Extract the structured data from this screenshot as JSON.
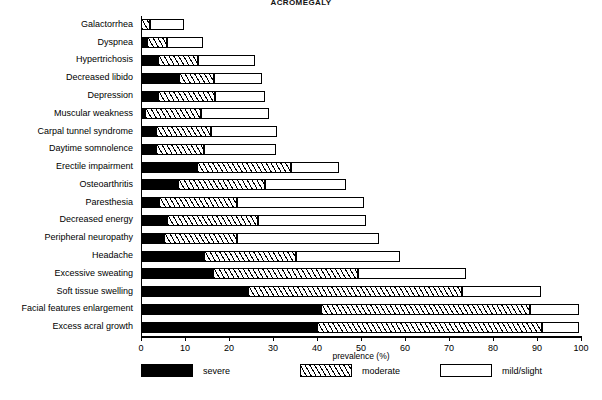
{
  "chart_data": {
    "type": "bar",
    "orientation": "horizontal",
    "stacked": true,
    "title": "ACROMEGALY",
    "xlabel": "prevalence (%)",
    "ylabel": "",
    "xlim": [
      0,
      100
    ],
    "xticks": [
      0,
      10,
      20,
      30,
      40,
      50,
      60,
      70,
      80,
      90,
      100
    ],
    "grid": false,
    "legend_position": "bottom",
    "categories": [
      "Galactorrhea",
      "Dyspnea",
      "Hypertrichosis",
      "Decreased libido",
      "Depression",
      "Muscular weakness",
      "Carpal tunnel syndrome",
      "Daytime somnolence",
      "Erectile impairment",
      "Osteoarthritis",
      "Paresthesia",
      "Decreased energy",
      "Peripheral neuropathy",
      "Headache",
      "Excessive sweating",
      "Soft tissue swelling",
      "Facial features enlargement",
      "Excess acral growth"
    ],
    "series": [
      {
        "name": "severe",
        "pattern": "solid-black",
        "color": "#000000",
        "values": [
          0.0,
          1.3,
          3.8,
          8.7,
          3.8,
          1.0,
          3.5,
          3.5,
          12.8,
          8.5,
          4.2,
          6.0,
          5.2,
          14.3,
          16.3,
          24.3,
          41.0,
          39.9
        ]
      },
      {
        "name": "moderate",
        "pattern": "hatched",
        "color": "#ffffff",
        "values": [
          2.0,
          4.5,
          9.1,
          7.9,
          13.1,
          12.6,
          12.3,
          10.8,
          21.3,
          19.6,
          17.7,
          20.6,
          16.7,
          21.0,
          33.1,
          48.6,
          47.5,
          51.2
        ]
      },
      {
        "name": "mild/slight",
        "pattern": "white-outline",
        "color": "#ffffff",
        "values": [
          7.7,
          8.2,
          12.9,
          10.9,
          11.2,
          15.6,
          15.2,
          16.4,
          10.9,
          18.5,
          28.7,
          24.5,
          32.1,
          23.5,
          24.4,
          18.1,
          11.0,
          8.4
        ]
      }
    ],
    "totals": [
      9.7,
      14.0,
      25.8,
      27.5,
      28.1,
      29.2,
      31.0,
      30.7,
      45.0,
      46.6,
      50.6,
      51.1,
      54.0,
      58.8,
      73.8,
      91.0,
      99.5,
      99.5
    ]
  },
  "legend": {
    "items": [
      {
        "label": "severe",
        "swatch": "solid-black"
      },
      {
        "label": "moderate",
        "swatch": "hatched"
      },
      {
        "label": "mild/slight",
        "swatch": "white-outline"
      }
    ]
  }
}
